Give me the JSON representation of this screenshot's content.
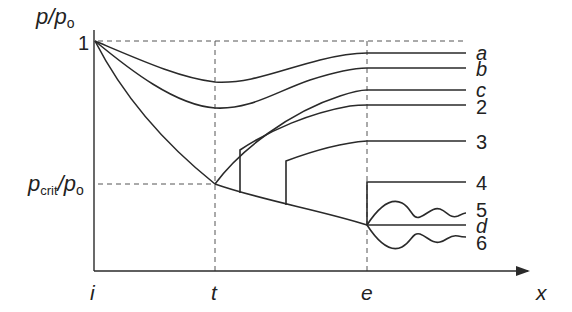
{
  "diagram": {
    "axes": {
      "y_label": "p/pₒ",
      "y_label_parts": {
        "p": "p",
        "slash": "/",
        "p0": "p",
        "sub0": "o"
      },
      "x_label": "x",
      "y_ticks": [
        {
          "label": "1"
        },
        {
          "label": "p_crit/p_o",
          "parts": {
            "p": "p",
            "sub": "crit",
            "slash": "/",
            "p0": "p",
            "sub0": "o"
          }
        }
      ],
      "x_ticks": [
        {
          "label": "i"
        },
        {
          "label": "t"
        },
        {
          "label": "e"
        }
      ]
    },
    "curves": [
      {
        "id": "a",
        "label": "a",
        "italic": true
      },
      {
        "id": "b",
        "label": "b",
        "italic": true
      },
      {
        "id": "c",
        "label": "c",
        "italic": true
      },
      {
        "id": "2",
        "label": "2",
        "italic": false
      },
      {
        "id": "3",
        "label": "3",
        "italic": false
      },
      {
        "id": "4",
        "label": "4",
        "italic": false
      },
      {
        "id": "5",
        "label": "5",
        "italic": false
      },
      {
        "id": "d",
        "label": "d",
        "italic": true
      },
      {
        "id": "6",
        "label": "6",
        "italic": false
      }
    ],
    "colors": {
      "line": "#2a2a2a",
      "guide": "#555555",
      "background": "#ffffff"
    }
  }
}
